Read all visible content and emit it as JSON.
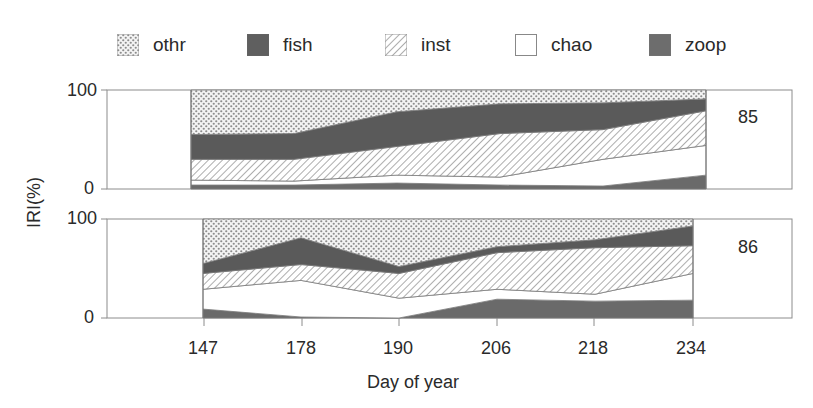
{
  "chart_data": {
    "type": "area",
    "stacked": true,
    "title": "",
    "xlabel": "Day of year",
    "ylabel": "IRI(%)",
    "x_categories": [
      "147",
      "178",
      "190",
      "206",
      "218",
      "234"
    ],
    "ylim": [
      0,
      100
    ],
    "yticks": [
      "0",
      "100"
    ],
    "grid": false,
    "legend_position": "top",
    "legend": [
      "othr",
      "fish",
      "inst",
      "chao",
      "zoop"
    ],
    "stack_order_bottom_to_top": [
      "zoop",
      "chao",
      "inst",
      "fish",
      "othr"
    ],
    "panels": [
      {
        "label": "85",
        "series": [
          {
            "name": "zoop",
            "values": [
              4,
              4,
              6,
              4,
              3,
              14
            ]
          },
          {
            "name": "chao",
            "values": [
              5,
              4,
              8,
              8,
              27,
              30
            ]
          },
          {
            "name": "inst",
            "values": [
              21,
              22,
              29,
              44,
              30,
              35
            ]
          },
          {
            "name": "fish",
            "values": [
              25,
              26,
              35,
              30,
              27,
              12
            ]
          },
          {
            "name": "othr",
            "values": [
              45,
              44,
              22,
              14,
              13,
              9
            ]
          }
        ]
      },
      {
        "label": "86",
        "series": [
          {
            "name": "zoop",
            "values": [
              9,
              1,
              0,
              19,
              17,
              18
            ]
          },
          {
            "name": "chao",
            "values": [
              20,
              37,
              20,
              10,
              7,
              27
            ]
          },
          {
            "name": "inst",
            "values": [
              16,
              16,
              25,
              37,
              47,
              28
            ]
          },
          {
            "name": "fish",
            "values": [
              10,
              27,
              7,
              6,
              8,
              20
            ]
          },
          {
            "name": "othr",
            "values": [
              45,
              19,
              48,
              28,
              21,
              7
            ]
          }
        ]
      }
    ]
  },
  "legend_items": [
    {
      "key": "othr",
      "label": "othr",
      "pattern": "crosshatch"
    },
    {
      "key": "fish",
      "label": "fish",
      "pattern": "solid-dark"
    },
    {
      "key": "inst",
      "label": "inst",
      "pattern": "diagonal-hatch"
    },
    {
      "key": "chao",
      "label": "chao",
      "pattern": "white"
    },
    {
      "key": "zoop",
      "label": "zoop",
      "pattern": "solid-dark"
    }
  ],
  "axis": {
    "ylabel": "IRI(%)",
    "xlabel": "Day of year",
    "y_top": "100",
    "y_bottom": "0",
    "xticks": [
      "147",
      "178",
      "190",
      "206",
      "218",
      "234"
    ]
  },
  "panel_labels": [
    "85",
    "86"
  ],
  "colors": {
    "fish": "#5a5a5a",
    "zoop": "#6a6a6a",
    "chao": "#ffffff",
    "othr_bg": "#f2f2f2",
    "othr_dot": "#8a8a8a",
    "inst_line": "#8a8a8a",
    "frame": "#8c8c8c"
  }
}
